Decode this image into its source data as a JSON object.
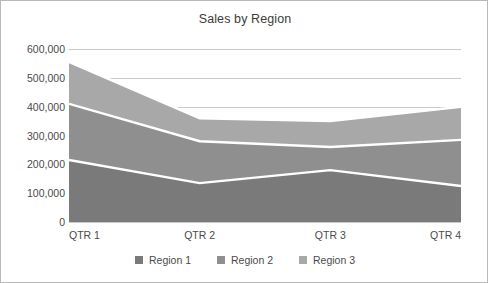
{
  "chart_data": {
    "type": "area",
    "stacked": true,
    "title": "Sales by Region",
    "xlabel": "",
    "ylabel": "",
    "categories": [
      "QTR 1",
      "QTR 2",
      "QTR 3",
      "QTR 4"
    ],
    "series": [
      {
        "name": "Region 1",
        "color": "#7a7a7a",
        "values": [
          215000,
          135000,
          180000,
          125000
        ]
      },
      {
        "name": "Region 2",
        "color": "#8f8f8f",
        "values": [
          195000,
          145000,
          80000,
          160000
        ]
      },
      {
        "name": "Region 3",
        "color": "#a8a8a8",
        "values": [
          145000,
          80000,
          90000,
          115000
        ]
      }
    ],
    "cumulative_tops": [
      [
        215000,
        135000,
        180000,
        125000
      ],
      [
        410000,
        280000,
        260000,
        285000
      ],
      [
        555000,
        360000,
        350000,
        400000
      ]
    ],
    "ylim": [
      0,
      600000
    ],
    "y_ticks": [
      0,
      100000,
      200000,
      300000,
      400000,
      500000,
      600000
    ],
    "y_tick_labels": [
      "0",
      "100,000",
      "200,000",
      "300,000",
      "400,000",
      "500,000",
      "600,000"
    ],
    "grid": true,
    "legend_position": "bottom"
  },
  "legend": {
    "items": [
      {
        "label": "Region 1",
        "color": "#7a7a7a"
      },
      {
        "label": "Region 2",
        "color": "#8f8f8f"
      },
      {
        "label": "Region 3",
        "color": "#a8a8a8"
      }
    ]
  },
  "style": {
    "gridline_color": "#c9c9c9",
    "text_color": "#4a4a4a",
    "title_color": "#3b3b3b",
    "separator_color": "#ffffff",
    "border_color": "#b9b9b9",
    "background": "#ffffff"
  }
}
